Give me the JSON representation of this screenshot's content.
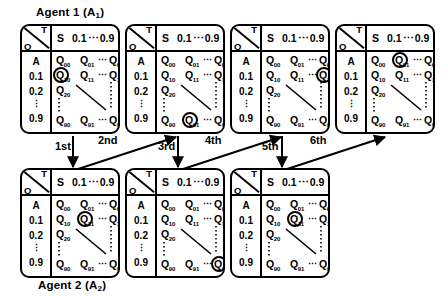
{
  "figure": {
    "type": "diagram",
    "agents": [
      {
        "id": "agent1",
        "label": "Agent 1 (A",
        "sub": "1",
        "close": ")"
      },
      {
        "id": "agent2",
        "label": "Agent 2 (A",
        "sub": "2",
        "close": ")"
      }
    ]
  },
  "table_template": {
    "corner": {
      "row_axis": "O",
      "col_axis": "T"
    },
    "column_headers": [
      "S",
      "0.1",
      "⋯",
      "0.9"
    ],
    "row_headers": [
      "A",
      "0.1",
      "0.2",
      "⋮",
      "0.9"
    ],
    "cell_labels": {
      "r0": [
        "Q",
        "Q",
        "Q"
      ],
      "r1": [
        "Q",
        "Q",
        "Q"
      ],
      "r2": [
        "Q"
      ],
      "r4": [
        "Q",
        "Q",
        "Q"
      ]
    },
    "cell_subscripts": {
      "r0": [
        "00",
        "01",
        "09"
      ],
      "r1": [
        "10",
        "11",
        "19"
      ],
      "r2": [
        "20"
      ],
      "r4": [
        "90",
        "91",
        "99"
      ]
    },
    "h_ellipsis": "⋯",
    "v_ellipsis": "⋮"
  },
  "tables": [
    {
      "id": "t1",
      "agent": "agent1",
      "order": 1,
      "highlight": "Q10",
      "highlight_row": 1,
      "highlight_col": 0
    },
    {
      "id": "t2",
      "agent": "agent1",
      "order": 2,
      "highlight": "Q91",
      "highlight_row": 4,
      "highlight_col": 1
    },
    {
      "id": "t3",
      "agent": "agent1",
      "order": 3,
      "highlight": "Q19",
      "highlight_row": 1,
      "highlight_col": 2
    },
    {
      "id": "t4",
      "agent": "agent1",
      "order": 4,
      "highlight": "Q01",
      "highlight_row": 0,
      "highlight_col": 1
    },
    {
      "id": "t5",
      "agent": "agent2",
      "order": 1,
      "highlight": "Q11",
      "highlight_row": 1,
      "highlight_col": 1
    },
    {
      "id": "t6",
      "agent": "agent2",
      "order": 2,
      "highlight": "Q99",
      "highlight_row": 4,
      "highlight_col": 2
    },
    {
      "id": "t7",
      "agent": "agent2",
      "order": 3,
      "highlight": "Q11",
      "highlight_row": 1,
      "highlight_col": 1
    }
  ],
  "steps": [
    {
      "id": "step1",
      "label": "1st",
      "direction": "down",
      "from": "t1",
      "to": "t5"
    },
    {
      "id": "step2",
      "label": "2nd",
      "direction": "up",
      "from": "t5",
      "to": "t2"
    },
    {
      "id": "step3",
      "label": "3rd",
      "direction": "down",
      "from": "t2",
      "to": "t6"
    },
    {
      "id": "step4",
      "label": "4th",
      "direction": "up",
      "from": "t6",
      "to": "t3"
    },
    {
      "id": "step5",
      "label": "5th",
      "direction": "down",
      "from": "t3",
      "to": "t7"
    },
    {
      "id": "step6",
      "label": "6th",
      "direction": "up",
      "from": "t7",
      "to": "t4"
    }
  ],
  "colors": {
    "ink": "#000000",
    "paper": "#ffffff"
  }
}
